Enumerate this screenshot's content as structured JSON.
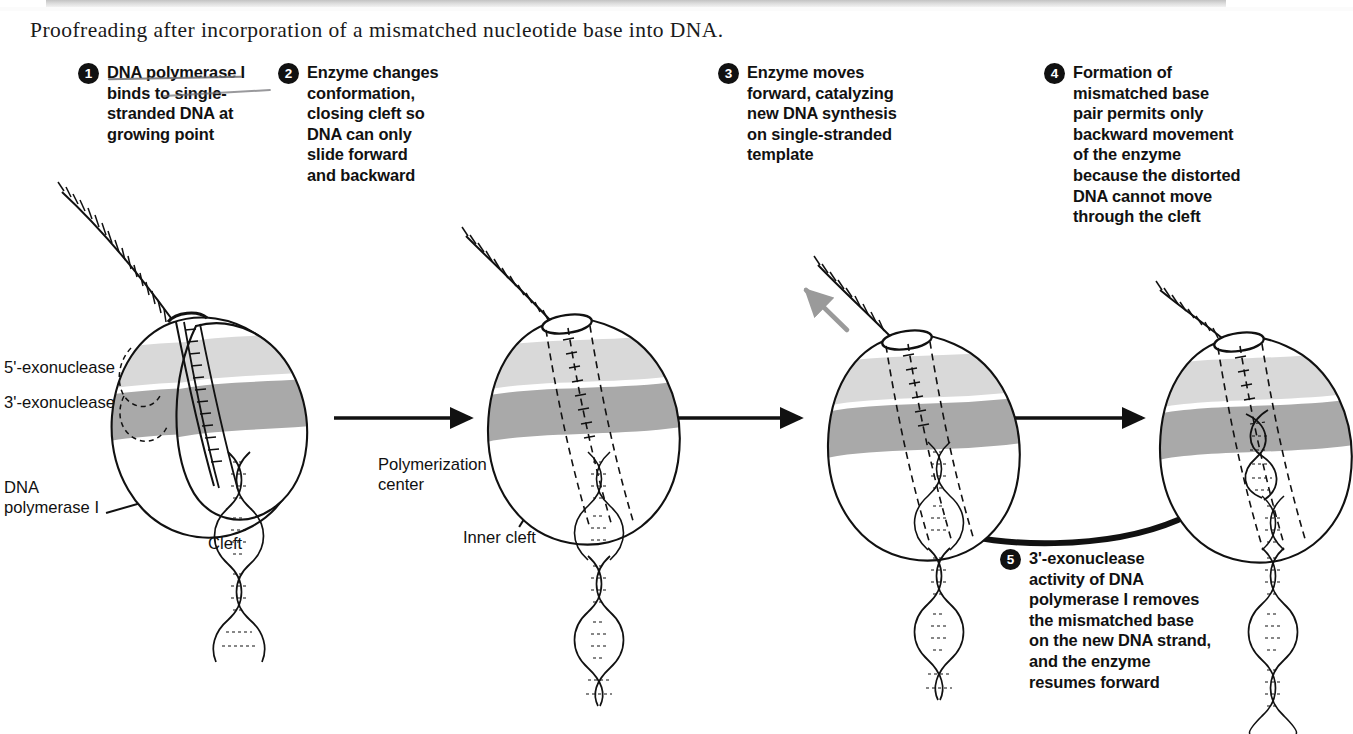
{
  "figure": {
    "caption": "Proofreading after incorporation of a mismatched nucleotide base into DNA.",
    "background_color": "#ffffff",
    "ink_color": "#111111",
    "band_light_color": "#d9d9d9",
    "band_mid_color": "#a9a9a9",
    "gray_arrow_color": "#9a9a9a"
  },
  "steps": [
    {
      "number": "1",
      "text": "DNA polymerase I\nbinds to single-\nstranded  DNA at\ngrowing point"
    },
    {
      "number": "2",
      "text": "Enzyme changes\nconformation,\nclosing cleft so\nDNA can only\nslide forward\nand backward"
    },
    {
      "number": "3",
      "text": "Enzyme moves\nforward, catalyzing\nnew DNA synthesis\non single-stranded\ntemplate"
    },
    {
      "number": "4",
      "text": "Formation of\nmismatched base\npair permits only\nbackward movement\nof the enzyme\nbecause the distorted\nDNA cannot move\nthrough the cleft"
    },
    {
      "number": "5",
      "text": "3'-exonuclease\nactivity of DNA\npolymerase I removes\nthe mismatched base\non the new DNA strand,\nand the enzyme\nresumes forward"
    }
  ],
  "labels": {
    "exo5": "5'-exonuclease",
    "exo3": "3'-exonuclease",
    "dna_pol": "DNA\npolymerase I",
    "cleft": "Cleft",
    "polymerization_center": "Polymerization\ncenter",
    "inner_cleft": "Inner cleft"
  }
}
